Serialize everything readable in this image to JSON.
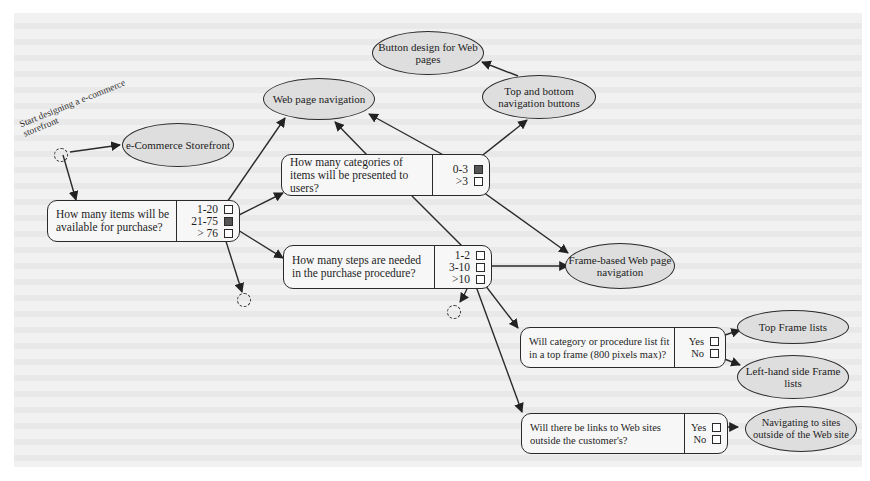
{
  "diagram": {
    "start_label": "Start designing a e-commerce storefront",
    "nodes": {
      "storefront": "e-Commerce Storefront",
      "web_nav": "Web page navigation",
      "button_design": "Button design for Web pages",
      "top_bottom_nav": "Top and bottom navigation buttons",
      "frame_nav": "Frame-based Web page navigation",
      "top_frame_lists": "Top Frame lists",
      "left_frame_lists": "Left-hand side Frame lists",
      "outside_sites": "Navigating to sites outside of the Web site"
    },
    "questions": [
      {
        "id": "items",
        "text": "How many items will be available for purchase?",
        "options": [
          "1-20",
          "21-75",
          "> 76"
        ]
      },
      {
        "id": "categories",
        "text": "How many categories of items will be presented to users?",
        "options": [
          "0-3",
          ">3"
        ]
      },
      {
        "id": "steps",
        "text": "How many steps are needed in the purchase procedure?",
        "options": [
          "1-2",
          "3-10",
          ">10"
        ]
      },
      {
        "id": "top_frame",
        "text": "Will category or procedure list fit in a top frame (800 pixels max)?",
        "options": [
          "Yes",
          "No"
        ]
      },
      {
        "id": "links",
        "text": "Will there be links to Web sites outside the customer's?",
        "options": [
          "Yes",
          "No"
        ]
      }
    ],
    "edges": [
      [
        "start",
        "storefront"
      ],
      [
        "start",
        "items"
      ],
      [
        "items.1-20",
        "web_nav"
      ],
      [
        "items.21-75",
        "categories"
      ],
      [
        "items.21-75",
        "steps"
      ],
      [
        "items.>76",
        "stub"
      ],
      [
        "categories",
        "web_nav"
      ],
      [
        "categories.0-3",
        "web_nav"
      ],
      [
        "categories.0-3",
        "top_bottom_nav"
      ],
      [
        "categories.>3",
        "frame_nav"
      ],
      [
        "top_bottom_nav",
        "button_design"
      ],
      [
        "steps.1-2",
        "web_nav"
      ],
      [
        "steps.3-10",
        "frame_nav"
      ],
      [
        "steps.3-10",
        "top_frame"
      ],
      [
        "steps.3-10",
        "links"
      ],
      [
        "steps.>10",
        "stub"
      ],
      [
        "top_frame.Yes",
        "top_frame_lists"
      ],
      [
        "top_frame.No",
        "left_frame_lists"
      ],
      [
        "links.Yes",
        "outside_sites"
      ]
    ],
    "colors": {
      "ellipse_fill": "#dedede",
      "line": "#2a2a2a",
      "paper": "#f1f1f1"
    }
  }
}
